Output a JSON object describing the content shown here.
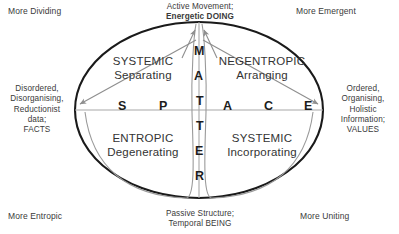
{
  "diagram": {
    "title_axes": {
      "vertical_word": "MATTER",
      "horizontal_word": "SPACE",
      "vertical_letters": [
        "M",
        "A",
        "T",
        "T",
        "E",
        "R"
      ],
      "horizontal_letters": [
        "S",
        "P",
        "A",
        "C",
        "E"
      ]
    },
    "outer_labels": {
      "top_center": [
        "Active Movement;",
        "Energetic DOING"
      ],
      "bottom_center": [
        "Passive Structure;",
        "Temporal BEING"
      ],
      "left_middle": [
        "Disordered,",
        "Disorganising,",
        "Reductionist",
        "data;",
        "FACTS"
      ],
      "right_middle": [
        "Ordered,",
        "Organising,",
        "Holistic",
        "Information;",
        "VALUES"
      ],
      "top_left": "More Dividing",
      "top_right": "More Emergent",
      "bottom_left": "More Entropic",
      "bottom_right": "More Uniting"
    },
    "quadrants": [
      {
        "id": "top-left",
        "cap": "SYSTEMIC",
        "sub": "Separating"
      },
      {
        "id": "top-right",
        "cap": "NEGENTROPIC",
        "sub": "Arranging"
      },
      {
        "id": "bottom-left",
        "cap": "ENTROPIC",
        "sub": "Degenerating"
      },
      {
        "id": "bottom-right",
        "cap": "SYSTEMIC",
        "sub": "Incorporating"
      }
    ],
    "colors": {
      "ellipse_stroke": "#1a1a1a",
      "inner_curve_stroke": "#9a9a9a",
      "axis_stroke": "#a8a8a8",
      "arrow_stroke": "#8f8f8f",
      "text": "#333333",
      "background": "#ffffff"
    }
  }
}
